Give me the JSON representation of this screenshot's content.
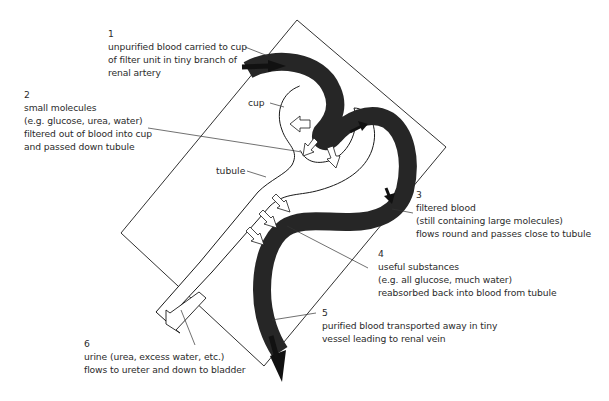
{
  "diagram": {
    "colors": {
      "blood": "#262626",
      "outline": "#1a1a1a",
      "text": "#2b2b2b",
      "background": "#ffffff"
    },
    "structure_labels": {
      "cup": "cup",
      "tubule": "tubule"
    },
    "steps": [
      {
        "number": "1",
        "lines": [
          "unpurified blood carried to cup",
          "of filter unit in tiny branch of",
          "renal artery"
        ]
      },
      {
        "number": "2",
        "lines": [
          "small molecules",
          "(e.g. glucose, urea, water)",
          "filtered out of blood into cup",
          "and passed down tubule"
        ]
      },
      {
        "number": "3",
        "lines": [
          "filtered blood",
          "(still containing large molecules)",
          "flows round and passes close to tubule"
        ]
      },
      {
        "number": "4",
        "lines": [
          "useful substances",
          "(e.g. all glucose, much water)",
          "reabsorbed back into blood from tubule"
        ]
      },
      {
        "number": "5",
        "lines": [
          "purified blood transported away in tiny",
          "vessel leading to renal vein"
        ]
      },
      {
        "number": "6",
        "lines": [
          "urine (urea, excess water, etc.)",
          "flows to ureter and down to bladder"
        ]
      }
    ],
    "icons": {
      "blood_flow_arrow": "black-arrow",
      "filtration_arrow": "white-block-arrow",
      "urine_arrow": "white-block-arrow"
    }
  }
}
